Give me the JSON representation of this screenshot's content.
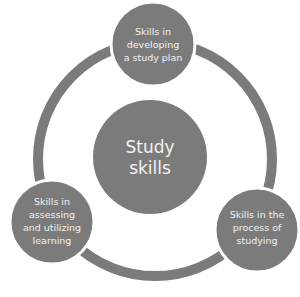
{
  "diagram": {
    "type": "cycle",
    "colors": {
      "ring": "#7b7b7b",
      "node_fill": "#7b7b7b",
      "node_border": "#ffffff",
      "text": "#f2f2f2",
      "background": "#ffffff"
    },
    "center": {
      "lines": [
        "Study",
        "skills"
      ]
    },
    "nodes": [
      {
        "position": "top",
        "lines": [
          "Skills in",
          "developing",
          "a study plan"
        ]
      },
      {
        "position": "bottom-right",
        "lines": [
          "Skills in the",
          "process of",
          "studying"
        ]
      },
      {
        "position": "bottom-left",
        "lines": [
          "Skills in",
          "assessing",
          "and utilizing",
          "learning"
        ]
      }
    ]
  }
}
